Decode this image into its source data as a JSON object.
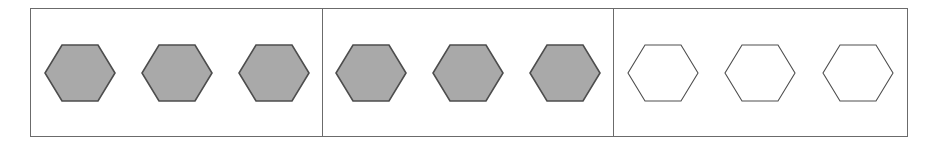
{
  "figure": {
    "type": "shape-grid-diagram",
    "background_color": "#ffffff",
    "frame": {
      "border_color": "#6b6b6b",
      "fill_color": "#ffffff",
      "divider_color": "#6b6b6b",
      "divider_count": 2
    },
    "shape_style": {
      "shape_name": "hexagon",
      "orientation": "pointy-left-right",
      "filled_fill_color": "#a9a9a9",
      "filled_stroke_color": "#4d4d4d",
      "empty_fill_color": "#ffffff",
      "empty_stroke_color": "#4f4f4f"
    },
    "cells": [
      {
        "id": "cell-1",
        "label": "Cell 1",
        "shape_count": 3,
        "shapes": [
          {
            "name": "hexagon",
            "fill": "gray",
            "label": "Hexagon 1"
          },
          {
            "name": "hexagon",
            "fill": "gray",
            "label": "Hexagon 2"
          },
          {
            "name": "hexagon",
            "fill": "gray",
            "label": "Hexagon 3"
          }
        ]
      },
      {
        "id": "cell-2",
        "label": "Cell 2",
        "shape_count": 3,
        "shapes": [
          {
            "name": "hexagon",
            "fill": "gray",
            "label": "Hexagon 1"
          },
          {
            "name": "hexagon",
            "fill": "gray",
            "label": "Hexagon 2"
          },
          {
            "name": "hexagon",
            "fill": "gray",
            "label": "Hexagon 3"
          }
        ]
      },
      {
        "id": "cell-3",
        "label": "Cell 3",
        "shape_count": 3,
        "shapes": [
          {
            "name": "hexagon",
            "fill": "white",
            "label": "Hexagon 1"
          },
          {
            "name": "hexagon",
            "fill": "white",
            "label": "Hexagon 2"
          },
          {
            "name": "hexagon",
            "fill": "white",
            "label": "Hexagon 3"
          }
        ]
      }
    ]
  }
}
